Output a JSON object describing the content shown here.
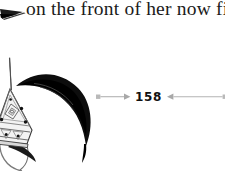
{
  "page": {
    "background_color": "#ffffff",
    "width": 225,
    "height": 171
  },
  "body_text": {
    "line": "on the front of her now fi",
    "text_color": "#1b1b1b",
    "clipped_right": true
  },
  "illustration": {
    "name": "plumed-helmet-illustration",
    "description": "ornate pointed helmet with diamond and triangle patterning, dark studs, a thin top spike, a chin strap curve, and a large black plume sweeping right",
    "plume_color": "#101010",
    "outline_color": "#2a2a2a",
    "shading_color": "#b9b9b9"
  },
  "corner_ornament": {
    "name": "wedge-ornament",
    "color": "#1a1a1a"
  },
  "folio": {
    "number": "158",
    "number_color": "#111111",
    "rule_color": "#b3b3b3",
    "left_rule_icon": "arrow-right-rule",
    "right_rule_icon": "arrow-left-rule"
  }
}
